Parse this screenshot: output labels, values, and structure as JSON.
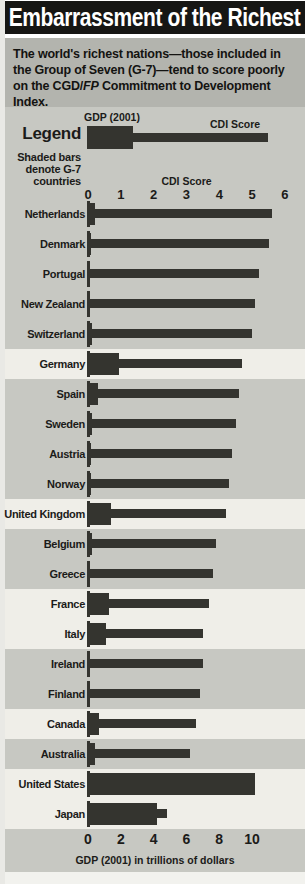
{
  "page": {
    "title": "Embarrassment of the Richest",
    "subtitle_before_fp": "The world's richest nations—those included in the Group of Seven (G-7)—tend to score poorly on the CGD/",
    "subtitle_fp": "FP",
    "subtitle_after_fp": " Commitment to Development Index."
  },
  "legend": {
    "heading": "Legend",
    "gdp_label": "GDP (2001)",
    "cdi_label": "CDI Score",
    "note_line1": "Shaded bars",
    "note_line2": "denote G-7",
    "note_line3": "countries"
  },
  "chart_data": {
    "type": "bar",
    "orientation": "horizontal",
    "series_note": "Each country shows two overlaid bars: thick bar = GDP (2001) read on the bottom axis; thin bar = CDI Score read on the top axis. Shaded rows denote G-7 countries.",
    "top_axis": {
      "title": "CDI Score",
      "ticks": [
        0,
        1,
        2,
        3,
        4,
        5,
        6
      ],
      "range": [
        0,
        6
      ]
    },
    "bottom_axis": {
      "title": "GDP (2001) in trillions of dollars",
      "ticks": [
        0,
        2,
        4,
        6,
        8,
        10
      ],
      "range": [
        0,
        10.5
      ]
    },
    "countries": [
      {
        "name": "Netherlands",
        "g7": false,
        "gdp_trillions": 0.4,
        "cdi_score": 5.6
      },
      {
        "name": "Denmark",
        "g7": false,
        "gdp_trillions": 0.16,
        "cdi_score": 5.5
      },
      {
        "name": "Portugal",
        "g7": false,
        "gdp_trillions": 0.12,
        "cdi_score": 5.2
      },
      {
        "name": "New Zealand",
        "g7": false,
        "gdp_trillions": 0.05,
        "cdi_score": 5.1
      },
      {
        "name": "Switzerland",
        "g7": false,
        "gdp_trillions": 0.25,
        "cdi_score": 5.0
      },
      {
        "name": "Germany",
        "g7": true,
        "gdp_trillions": 1.9,
        "cdi_score": 4.7
      },
      {
        "name": "Spain",
        "g7": false,
        "gdp_trillions": 0.6,
        "cdi_score": 4.6
      },
      {
        "name": "Sweden",
        "g7": false,
        "gdp_trillions": 0.22,
        "cdi_score": 4.5
      },
      {
        "name": "Austria",
        "g7": false,
        "gdp_trillions": 0.19,
        "cdi_score": 4.4
      },
      {
        "name": "Norway",
        "g7": false,
        "gdp_trillions": 0.17,
        "cdi_score": 4.3
      },
      {
        "name": "United Kingdom",
        "g7": true,
        "gdp_trillions": 1.4,
        "cdi_score": 4.2
      },
      {
        "name": "Belgium",
        "g7": false,
        "gdp_trillions": 0.23,
        "cdi_score": 3.9
      },
      {
        "name": "Greece",
        "g7": false,
        "gdp_trillions": 0.13,
        "cdi_score": 3.8
      },
      {
        "name": "France",
        "g7": true,
        "gdp_trillions": 1.3,
        "cdi_score": 3.7
      },
      {
        "name": "Italy",
        "g7": true,
        "gdp_trillions": 1.1,
        "cdi_score": 3.5
      },
      {
        "name": "Ireland",
        "g7": false,
        "gdp_trillions": 0.1,
        "cdi_score": 3.5
      },
      {
        "name": "Finland",
        "g7": false,
        "gdp_trillions": 0.12,
        "cdi_score": 3.4
      },
      {
        "name": "Canada",
        "g7": true,
        "gdp_trillions": 0.7,
        "cdi_score": 3.3
      },
      {
        "name": "Australia",
        "g7": false,
        "gdp_trillions": 0.4,
        "cdi_score": 3.1
      },
      {
        "name": "United States",
        "g7": true,
        "gdp_trillions": 10.2,
        "cdi_score": null,
        "note": "CDI bar hidden behind GDP bar"
      },
      {
        "name": "Japan",
        "g7": true,
        "gdp_trillions": 4.2,
        "cdi_score": 2.4
      }
    ],
    "colors": {
      "bar": "#34342f",
      "chart_bg": "#c7c8c2",
      "g7_band": "#efeee8",
      "subtitle_band": "#b3b4ae",
      "title_band": "#161614",
      "title_text": "#ffffff"
    }
  }
}
